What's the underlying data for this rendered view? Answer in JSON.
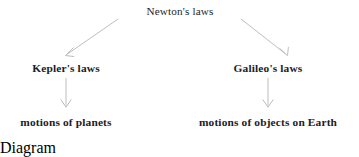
{
  "diagram": {
    "kind": "tree-flowchart",
    "title_text": "Newton's laws",
    "background_color": "#ffffff",
    "text_color": "#1d1d1f",
    "arrow_color": "#b5b5b5",
    "nodes": [
      {
        "id": "root",
        "label": "Newton's laws",
        "level": "top"
      },
      {
        "id": "kepler",
        "label": "Kepler's laws",
        "level": "mid"
      },
      {
        "id": "galileo",
        "label": "Galileo's laws",
        "level": "mid"
      },
      {
        "id": "planets",
        "label": "motions of planets",
        "level": "leaf"
      },
      {
        "id": "earth",
        "label": "motions of objects on Earth",
        "level": "leaf"
      }
    ],
    "edges": [
      {
        "id": "root-to-kepler",
        "from": "root",
        "to": "kepler",
        "shape": "diagonal-left",
        "x1": 118,
        "y1": 19,
        "x2": 66,
        "y2": 55
      },
      {
        "id": "root-to-galileo",
        "from": "root",
        "to": "galileo",
        "shape": "diagonal-right",
        "x1": 241,
        "y1": 19,
        "x2": 287,
        "y2": 55
      },
      {
        "id": "kepler-to-planets",
        "from": "kepler",
        "to": "planets",
        "shape": "vertical",
        "x1": 66,
        "y1": 78,
        "x2": 66,
        "y2": 107
      },
      {
        "id": "galileo-to-earth",
        "from": "galileo",
        "to": "earth",
        "shape": "vertical",
        "x1": 268,
        "y1": 78,
        "x2": 268,
        "y2": 107
      }
    ]
  }
}
